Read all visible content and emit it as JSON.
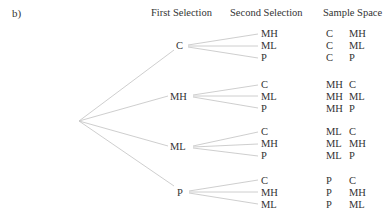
{
  "part_label": "b)",
  "headers": {
    "first": "First Selection",
    "second": "Second Selection",
    "sample": "Sample Space"
  },
  "tree": {
    "branches": [
      {
        "label": "C",
        "children": [
          "MH",
          "ML",
          "P"
        ],
        "sample_space": [
          [
            "C",
            "MH"
          ],
          [
            "C",
            "ML"
          ],
          [
            "C",
            "P"
          ]
        ]
      },
      {
        "label": "MH",
        "children": [
          "C",
          "ML",
          "P"
        ],
        "sample_space": [
          [
            "MH",
            "C"
          ],
          [
            "MH",
            "ML"
          ],
          [
            "MH",
            "P"
          ]
        ]
      },
      {
        "label": "ML",
        "children": [
          "C",
          "MH",
          "P"
        ],
        "sample_space": [
          [
            "ML",
            "C"
          ],
          [
            "ML",
            "MH"
          ],
          [
            "ML",
            "P"
          ]
        ]
      },
      {
        "label": "P",
        "children": [
          "C",
          "MH",
          "ML"
        ],
        "sample_space": [
          [
            "P",
            "C"
          ],
          [
            "P",
            "MH"
          ],
          [
            "P",
            "ML"
          ]
        ]
      }
    ]
  },
  "colors": {
    "text": "#333333",
    "lines": "#c8c8c8"
  }
}
